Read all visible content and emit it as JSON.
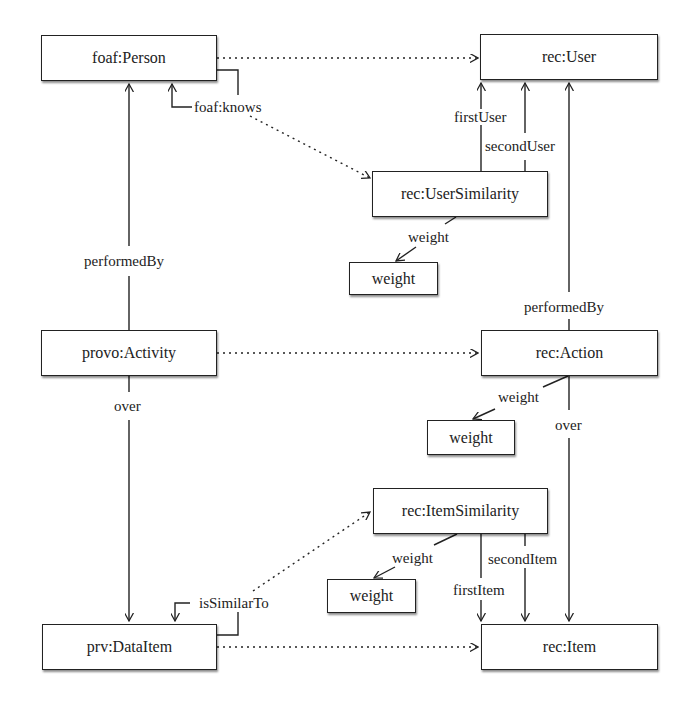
{
  "diagram": {
    "nodes": [
      {
        "id": "foaf_person",
        "label": "foaf:Person"
      },
      {
        "id": "rec_user",
        "label": "rec:User"
      },
      {
        "id": "rec_user_similarity",
        "label": "rec:UserSimilarity"
      },
      {
        "id": "weight_user_sim",
        "label": "weight"
      },
      {
        "id": "provo_activity",
        "label": "provo:Activity"
      },
      {
        "id": "rec_action",
        "label": "rec:Action"
      },
      {
        "id": "weight_action",
        "label": "weight"
      },
      {
        "id": "rec_item_similarity",
        "label": "rec:ItemSimilarity"
      },
      {
        "id": "weight_item_sim",
        "label": "weight"
      },
      {
        "id": "prv_dataitem",
        "label": "prv:DataItem"
      },
      {
        "id": "rec_item",
        "label": "rec:Item"
      }
    ],
    "edge_labels": {
      "foaf_knows": "foaf:knows",
      "first_user": "firstUser",
      "second_user": "secondUser",
      "user_sim_weight": "weight",
      "activity_performed_by": "performedBy",
      "action_performed_by": "performedBy",
      "activity_over": "over",
      "action_over": "over",
      "action_weight": "weight",
      "is_similar_to": "isSimilarTo",
      "item_sim_weight": "weight",
      "first_item": "firstItem",
      "second_item": "secondItem"
    },
    "edges": [
      {
        "from": "foaf_person",
        "to": "rec_user",
        "style": "dotted",
        "label": ""
      },
      {
        "from": "foaf_person",
        "to": "foaf_person",
        "style": "solid",
        "label": "foaf:knows"
      },
      {
        "from": "foaf_person",
        "to": "rec_user_similarity",
        "style": "dotted",
        "label": ""
      },
      {
        "from": "rec_user_similarity",
        "to": "rec_user",
        "style": "solid",
        "label": "firstUser"
      },
      {
        "from": "rec_user_similarity",
        "to": "rec_user",
        "style": "solid",
        "label": "secondUser"
      },
      {
        "from": "rec_user_similarity",
        "to": "weight_user_sim",
        "style": "solid",
        "label": "weight"
      },
      {
        "from": "provo_activity",
        "to": "foaf_person",
        "style": "solid",
        "label": "performedBy"
      },
      {
        "from": "provo_activity",
        "to": "rec_action",
        "style": "dotted",
        "label": ""
      },
      {
        "from": "rec_action",
        "to": "rec_user",
        "style": "solid",
        "label": "performedBy"
      },
      {
        "from": "rec_action",
        "to": "weight_action",
        "style": "solid",
        "label": "weight"
      },
      {
        "from": "provo_activity",
        "to": "prv_dataitem",
        "style": "solid",
        "label": "over"
      },
      {
        "from": "rec_action",
        "to": "rec_item",
        "style": "solid",
        "label": "over"
      },
      {
        "from": "prv_dataitem",
        "to": "prv_dataitem",
        "style": "solid",
        "label": "isSimilarTo"
      },
      {
        "from": "prv_dataitem",
        "to": "rec_item_similarity",
        "style": "dotted",
        "label": ""
      },
      {
        "from": "rec_item_similarity",
        "to": "weight_item_sim",
        "style": "solid",
        "label": "weight"
      },
      {
        "from": "rec_item_similarity",
        "to": "rec_item",
        "style": "solid",
        "label": "firstItem"
      },
      {
        "from": "rec_item_similarity",
        "to": "rec_item",
        "style": "solid",
        "label": "secondItem"
      },
      {
        "from": "prv_dataitem",
        "to": "rec_item",
        "style": "dotted",
        "label": ""
      }
    ]
  }
}
